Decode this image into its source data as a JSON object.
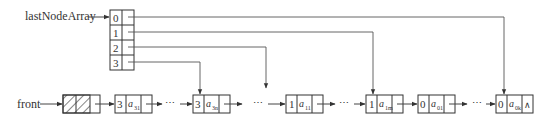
{
  "diagram": {
    "array_label": "lastNodeArray",
    "front_label": "front",
    "array_indices": [
      "0",
      "1",
      "2",
      "3"
    ],
    "ellipsis": "⋯",
    "null_symbol": "∧",
    "nodes": [
      {
        "key": "3",
        "value": "a",
        "sub": "31"
      },
      {
        "key": "3",
        "value": "a",
        "sub": "3n"
      },
      {
        "key": "1",
        "value": "a",
        "sub": "11"
      },
      {
        "key": "1",
        "value": "a",
        "sub": "1m"
      },
      {
        "key": "0",
        "value": "a",
        "sub": "01"
      },
      {
        "key": "0",
        "value": "a",
        "sub": "0k"
      }
    ],
    "colors": {
      "line": "#444444",
      "box": "#333333"
    }
  }
}
